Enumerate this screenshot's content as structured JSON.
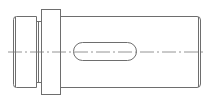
{
  "diagram": {
    "type": "technical-drawing",
    "line_color": "#6e6e6e",
    "centerline_color": "#7a7a7a",
    "background": "#ffffff",
    "parts": [
      {
        "name": "left-journal",
        "x": 12,
        "y": 16,
        "w": 25,
        "h": 72
      },
      {
        "name": "neck",
        "x": 37,
        "y": 21,
        "w": 4,
        "h": 62
      },
      {
        "name": "collar",
        "x": 41,
        "y": 9,
        "w": 19,
        "h": 86
      },
      {
        "name": "main-shaft",
        "x": 60,
        "y": 16,
        "w": 140,
        "h": 72
      },
      {
        "name": "keyway-slot",
        "x": 73,
        "y": 42,
        "w": 64,
        "h": 19
      }
    ],
    "centerline_y": 52
  }
}
